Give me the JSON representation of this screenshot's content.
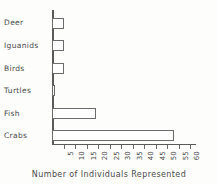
{
  "chart_data": {
    "type": "bar",
    "orientation": "horizontal",
    "title": "",
    "subtitle": "",
    "xlabel": "Number of Individuals Represented",
    "ylabel": "",
    "categories": [
      "Deer",
      "Iguanids",
      "Birds",
      "Turtles",
      "Fish",
      "Crabs"
    ],
    "values": [
      5,
      5,
      5,
      1,
      19,
      53
    ],
    "series": [
      {
        "name": "Number of Individuals Represented",
        "values": [
          5,
          5,
          5,
          1,
          19,
          53
        ]
      }
    ],
    "xlim": [
      0,
      60
    ],
    "ylim": [
      0,
      6
    ],
    "xticks": [
      5,
      10,
      15,
      20,
      25,
      30,
      35,
      40,
      45,
      50,
      55,
      60
    ],
    "xtick_labels": [
      "5",
      "10",
      "15",
      "20",
      "25",
      "30",
      "35",
      "40",
      "45",
      "50",
      "55",
      "60"
    ],
    "xtick_label_rotation": 90,
    "grid": false,
    "legend": false,
    "legend_position": "none",
    "bar_fill_color": "#ffffff",
    "bar_edge_color": "#6b6b6b",
    "axis_color": "#5a5a5a",
    "text_color": "#4a4a4a",
    "background_color": "#fdfdfc"
  }
}
